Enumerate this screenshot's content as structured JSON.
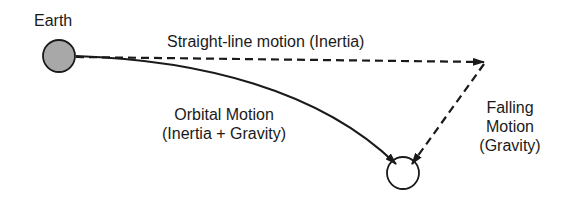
{
  "labels": {
    "earth": "Earth",
    "straight_line": "Straight-line motion (Inertia)",
    "orbital_line1": "Orbital Motion",
    "orbital_line2": "(Inertia + Gravity)",
    "falling_line1": "Falling",
    "falling_line2": "Motion",
    "falling_line3": "(Gravity)"
  },
  "colors": {
    "earth_fill": "#a8a8a8",
    "stroke": "#1a1a1a",
    "background": "#ffffff"
  }
}
